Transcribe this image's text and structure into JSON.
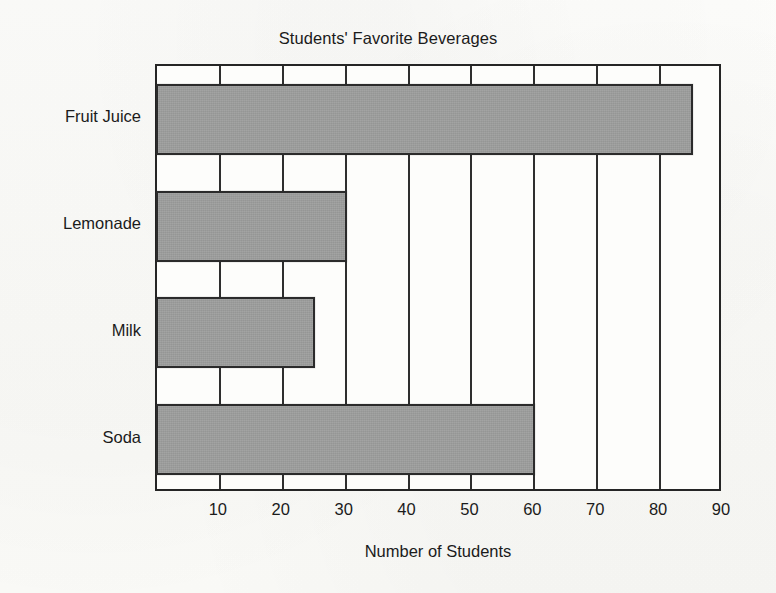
{
  "chart_data": {
    "type": "bar",
    "orientation": "horizontal",
    "title": "Students' Favorite Beverages",
    "xlabel": "Number of  Students",
    "ylabel": "",
    "categories": [
      "Fruit Juice",
      "Lemonade",
      "Milk",
      "Soda"
    ],
    "values": [
      85,
      30,
      25,
      60
    ],
    "xlim": [
      0,
      90
    ],
    "xticks": [
      10,
      20,
      30,
      40,
      50,
      60,
      70,
      80,
      90
    ],
    "xtick_labels": [
      "10",
      "20",
      "30",
      "40",
      "50",
      "60",
      "70",
      "80",
      "90"
    ],
    "grid": "vertical-only",
    "legend": "none",
    "bar_color": "#9a9b9a",
    "bar_edge_color": "#2b2b2b",
    "axis_color": "#252525",
    "background_color": "#fdfdfb"
  },
  "labels": {
    "title": "Students' Favorite Beverages",
    "x_axis": "Number of  Students"
  }
}
